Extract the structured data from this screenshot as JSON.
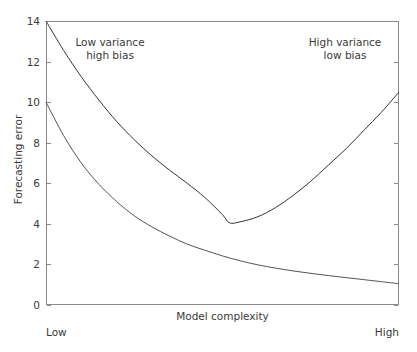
{
  "chart_data": {
    "type": "line",
    "title": "",
    "xlabel": "Model complexity",
    "ylabel": "Forecasting error",
    "xlim": [
      0,
      1
    ],
    "ylim": [
      0,
      14
    ],
    "grid": false,
    "legend": "none",
    "xtick_labels": [
      "Low",
      "High"
    ],
    "ytick_values": [
      0,
      2,
      4,
      6,
      8,
      10,
      12,
      14
    ],
    "ytick_labels": [
      "0",
      "2",
      "4",
      "6",
      "8",
      "10",
      "12",
      "14"
    ],
    "annotations": [
      {
        "text_line1": "Low variance",
        "text_line2": "high bias",
        "position": "upper-left"
      },
      {
        "text_line1": "High variance",
        "text_line2": "low bias",
        "position": "upper-right"
      }
    ],
    "series": [
      {
        "name": "total-error",
        "shape": "u-curve",
        "color": "#333333",
        "x": [
          0.0,
          0.05,
          0.1,
          0.15,
          0.2,
          0.25,
          0.3,
          0.35,
          0.4,
          0.45,
          0.5,
          0.52,
          0.55,
          0.6,
          0.65,
          0.7,
          0.75,
          0.8,
          0.85,
          0.9,
          0.95,
          1.0
        ],
        "values": [
          14.0,
          12.55,
          11.25,
          10.1,
          9.05,
          8.15,
          7.35,
          6.65,
          6.0,
          5.3,
          4.45,
          4.05,
          4.1,
          4.35,
          4.8,
          5.4,
          6.1,
          6.9,
          7.7,
          8.6,
          9.5,
          10.5
        ]
      },
      {
        "name": "bias-error",
        "shape": "decay",
        "color": "#555555",
        "x": [
          0.0,
          0.05,
          0.1,
          0.15,
          0.2,
          0.25,
          0.3,
          0.35,
          0.4,
          0.45,
          0.5,
          0.55,
          0.6,
          0.65,
          0.7,
          0.75,
          0.8,
          0.85,
          0.9,
          0.95,
          1.0
        ],
        "values": [
          10.0,
          8.35,
          7.0,
          5.95,
          5.1,
          4.4,
          3.85,
          3.4,
          3.0,
          2.7,
          2.42,
          2.18,
          1.98,
          1.82,
          1.68,
          1.56,
          1.45,
          1.35,
          1.25,
          1.15,
          1.05
        ]
      }
    ]
  },
  "axis": {
    "ylabel": "Forecasting error",
    "xlabel": "Model complexity",
    "x_low_label": "Low",
    "x_high_label": "High",
    "ticks": [
      "0",
      "2",
      "4",
      "6",
      "8",
      "10",
      "12",
      "14"
    ]
  },
  "annotations": {
    "left": {
      "line1": "Low variance",
      "line2": "high bias"
    },
    "right": {
      "line1": "High variance",
      "line2": "low bias"
    }
  },
  "colors": {
    "background": "#ffffff",
    "axis": "#8a8a8a",
    "text": "#3a3a3a",
    "curve_total": "#333333",
    "curve_bias": "#555555"
  }
}
